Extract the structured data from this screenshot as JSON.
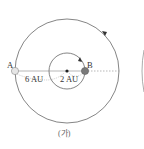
{
  "diagram": {
    "caption": "(가)",
    "points": {
      "A": {
        "label": "A",
        "color": "#e6e6e6"
      },
      "B": {
        "label": "B",
        "color": "#7a7a7a"
      }
    },
    "distances": {
      "outer": "6 AU",
      "inner": "2 AU"
    },
    "colors": {
      "orbit_line": "#666666",
      "dashed_line": "#888888",
      "center_dot": "#222222"
    }
  }
}
